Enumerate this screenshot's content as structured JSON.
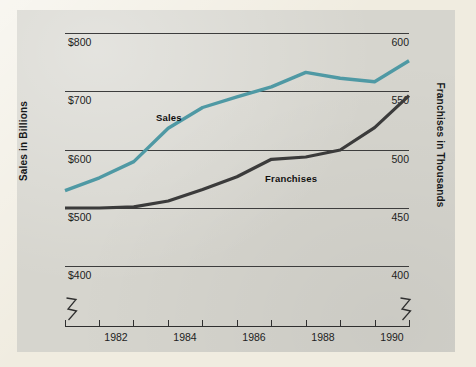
{
  "chart_data": {
    "type": "line",
    "title": "",
    "subtitle": "",
    "xlabel": "",
    "grid": true,
    "legend_position": "inline-labels",
    "x": [
      1981,
      1982,
      1983,
      1984,
      1985,
      1986,
      1987,
      1988,
      1989,
      1990,
      1991
    ],
    "x_tick_labels": [
      "1982",
      "1984",
      "1986",
      "1988",
      "1990"
    ],
    "x_tick_values": [
      1982,
      1984,
      1986,
      1988,
      1990
    ],
    "axes": [
      {
        "id": "left",
        "label": "Sales in Billions",
        "tick_labels": [
          "$800",
          "$700",
          "$600",
          "$500",
          "$400"
        ],
        "tick_values": [
          800,
          700,
          600,
          500,
          400
        ],
        "lim": [
          400,
          800
        ],
        "broken": true
      },
      {
        "id": "right",
        "label": "Franchises in Thousands",
        "tick_labels": [
          "600",
          "550",
          "500",
          "450",
          "400"
        ],
        "tick_values": [
          600,
          550,
          500,
          450,
          400
        ],
        "lim": [
          400,
          600
        ],
        "broken": true
      }
    ],
    "series": [
      {
        "name": "Sales",
        "axis": "left",
        "color": "#4f99a4",
        "unit": "billions of dollars",
        "values": [
          530,
          552,
          580,
          637,
          672,
          690,
          707,
          732,
          722,
          716,
          752
        ]
      },
      {
        "name": "Franchises",
        "axis": "right",
        "color": "#3b3b3b",
        "unit": "thousands",
        "values": [
          450,
          450,
          451,
          456,
          466,
          477,
          492,
          494,
          500,
          519,
          546
        ]
      }
    ],
    "annotations": [
      {
        "text": "Sales",
        "series": "Sales"
      },
      {
        "text": "Franchises",
        "series": "Franchises"
      }
    ]
  },
  "colors": {
    "sales_line": "#4f99a4",
    "franchises_line": "#3b3b3b",
    "panel_background": "#d6d5ce",
    "page_background": "#f0ece0",
    "gridline": "#3d3d3d",
    "text": "#1d1d1d"
  }
}
